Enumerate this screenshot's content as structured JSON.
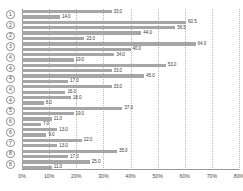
{
  "chart_data": {
    "type": "bar",
    "orientation": "horizontal",
    "title": "",
    "xlabel": "",
    "ylabel": "",
    "xlim": [
      0,
      80
    ],
    "xticks": [
      0,
      10,
      20,
      30,
      40,
      50,
      60,
      70,
      80
    ],
    "xtick_labels": [
      "0%",
      "10%",
      "20%",
      "30%",
      "40%",
      "50%",
      "60%",
      "70%",
      "80%"
    ],
    "grid": true,
    "grid_axis": "x",
    "legend": "none",
    "bar_color": "#a6a6a6",
    "categories": [
      "1",
      "2",
      "3",
      "4",
      "5",
      "6",
      "7",
      "8"
    ],
    "category_label_style": "circled-number",
    "bars": [
      {
        "category": "1",
        "value": 33.0,
        "label": "33.0"
      },
      {
        "category": "1",
        "value": 14.0,
        "label": "14.0"
      },
      {
        "category": "2",
        "value": 60.5,
        "label": "60.5"
      },
      {
        "category": "2",
        "value": 56.5,
        "label": "56.5"
      },
      {
        "category": "2",
        "value": 44.0,
        "label": "44.0"
      },
      {
        "category": "2",
        "value": 23.0,
        "label": "23.0"
      },
      {
        "category": "3",
        "value": 64.0,
        "label": "64.0"
      },
      {
        "category": "3",
        "value": 40.0,
        "label": "40.0"
      },
      {
        "category": "4",
        "value": 34.0,
        "label": "34.0"
      },
      {
        "category": "4",
        "value": 19.0,
        "label": "19.0"
      },
      {
        "category": "4",
        "value": 53.0,
        "label": "53.0"
      },
      {
        "category": "4",
        "value": 33.0,
        "label": "33.0"
      },
      {
        "category": "4",
        "value": 45.0,
        "label": "45.0"
      },
      {
        "category": "4",
        "value": 17.0,
        "label": "17.0"
      },
      {
        "category": "4",
        "value": 33.0,
        "label": "33.0"
      },
      {
        "category": "4",
        "value": 16.0,
        "label": "16.0"
      },
      {
        "category": "4",
        "value": 18.0,
        "label": "18.0"
      },
      {
        "category": "4",
        "value": 8.0,
        "label": "8.0"
      },
      {
        "category": "5",
        "value": 37.0,
        "label": "37.0"
      },
      {
        "category": "5",
        "value": 19.0,
        "label": "19.0"
      },
      {
        "category": "6",
        "value": 11.0,
        "label": "11.0"
      },
      {
        "category": "6",
        "value": 7.0,
        "label": "7.0"
      },
      {
        "category": "6",
        "value": 13.0,
        "label": "13.0"
      },
      {
        "category": "6",
        "value": 9.0,
        "label": "9.0"
      },
      {
        "category": "7",
        "value": 22.0,
        "label": "22.0"
      },
      {
        "category": "7",
        "value": 13.0,
        "label": "13.0"
      },
      {
        "category": "8",
        "value": 35.0,
        "label": "35.0"
      },
      {
        "category": "8",
        "value": 17.0,
        "label": "17.0"
      },
      {
        "category": "8",
        "value": 25.0,
        "label": "25.0"
      },
      {
        "category": "8",
        "value": 11.0,
        "label": "11.0"
      }
    ],
    "category_rows": [
      {
        "label": "1",
        "row_start": 0,
        "row_span": 2
      },
      {
        "label": "2",
        "row_start": 2,
        "row_span": 2
      },
      {
        "label": "2",
        "row_start": 4,
        "row_span": 2
      },
      {
        "label": "3",
        "row_start": 6,
        "row_span": 2
      },
      {
        "label": "4",
        "row_start": 8,
        "row_span": 2
      },
      {
        "label": "4",
        "row_start": 10,
        "row_span": 2
      },
      {
        "label": "4",
        "row_start": 12,
        "row_span": 2
      },
      {
        "label": "4",
        "row_start": 14,
        "row_span": 2
      },
      {
        "label": "4",
        "row_start": 16,
        "row_span": 2
      },
      {
        "label": "5",
        "row_start": 18,
        "row_span": 2
      },
      {
        "label": "6",
        "row_start": 20,
        "row_span": 2
      },
      {
        "label": "6",
        "row_start": 22,
        "row_span": 2
      },
      {
        "label": "7",
        "row_start": 24,
        "row_span": 2
      },
      {
        "label": "8",
        "row_start": 26,
        "row_span": 2
      },
      {
        "label": "8",
        "row_start": 28,
        "row_span": 2
      }
    ]
  }
}
